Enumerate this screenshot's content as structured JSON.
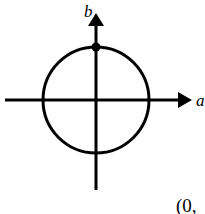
{
  "diagram": {
    "type": "complex-plane-circle",
    "axes": {
      "horizontal_label": "a",
      "vertical_label": "b"
    },
    "circle": {
      "center": [
        0,
        0
      ],
      "shape": "circle centered at origin"
    },
    "marked_point": {
      "position": "top intersection of circle with b-axis"
    },
    "caption_fragment": "(0,"
  }
}
